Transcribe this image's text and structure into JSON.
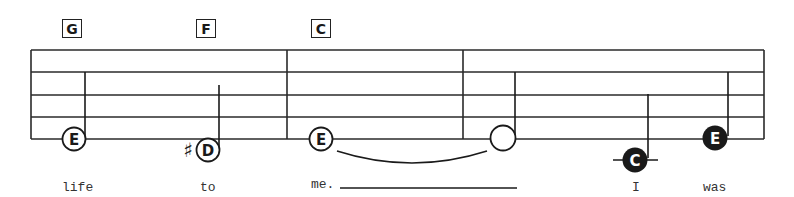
{
  "chords": [
    {
      "label": "G",
      "x": 62,
      "y": 19
    },
    {
      "label": "F",
      "x": 196,
      "y": 19
    },
    {
      "label": "C",
      "x": 311,
      "y": 19
    }
  ],
  "staff": {
    "left": 31,
    "right": 764,
    "line_y": [
      50,
      72,
      95,
      117,
      139
    ],
    "barlines_x": [
      287,
      463
    ]
  },
  "notes": [
    {
      "name": "E",
      "style": "open-lettered",
      "x": 74,
      "y": 139,
      "stem_x": 85,
      "stem_top": 72,
      "accidental": ""
    },
    {
      "name": "D",
      "style": "open-lettered",
      "x": 208,
      "y": 150,
      "stem_x": 219,
      "stem_top": 85,
      "accidental": "♯"
    },
    {
      "name": "E",
      "style": "open-lettered",
      "x": 321,
      "y": 139,
      "stem_x": null,
      "stem_top": null,
      "accidental": ""
    },
    {
      "name": "",
      "style": "open-blank",
      "x": 503,
      "y": 138,
      "stem_x": 515,
      "stem_top": 72,
      "accidental": ""
    },
    {
      "name": "C",
      "style": "filled-lettered",
      "x": 635,
      "y": 160,
      "stem_x": 648,
      "stem_top": 94,
      "accidental": "",
      "ledger": true
    },
    {
      "name": "E",
      "style": "filled-lettered",
      "x": 715,
      "y": 138,
      "stem_x": 728,
      "stem_top": 72,
      "accidental": ""
    }
  ],
  "tie": {
    "from_x": 337,
    "to_x": 487,
    "y": 151,
    "depth": 12
  },
  "lyrics": [
    {
      "text": "life",
      "x": 62,
      "y": 181
    },
    {
      "text": "to",
      "x": 200,
      "y": 181
    },
    {
      "text": "me.",
      "x": 311,
      "y": 181
    },
    {
      "text": "I",
      "x": 632,
      "y": 181
    },
    {
      "text": "was",
      "x": 703,
      "y": 181
    }
  ],
  "extender": {
    "x1": 340,
    "x2": 517,
    "y": 188
  },
  "colors": {
    "ink": "#1a1a1a",
    "paper": "#ffffff"
  }
}
